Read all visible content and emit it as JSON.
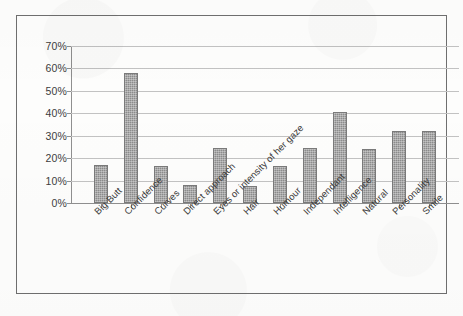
{
  "chart_data": {
    "type": "bar",
    "title": "",
    "subtitle": "",
    "xlabel": "",
    "ylabel": "",
    "ylim": [
      0,
      70
    ],
    "ytick_values": [
      0,
      10,
      20,
      30,
      40,
      50,
      60,
      70
    ],
    "ytick_labels": [
      "0%",
      "10%",
      "20%",
      "30%",
      "40%",
      "50%",
      "60%",
      "70%"
    ],
    "grid": true,
    "legend": false,
    "legend_position": "none",
    "categories": [
      "Big Butt",
      "Confidence",
      "Curves",
      "Direct approach",
      "Eyes or intensity of her gaze",
      "Hair",
      "Humour",
      "Independant",
      "Intelligence",
      "Natural",
      "Personality",
      "Smile"
    ],
    "values": [
      17,
      58,
      16.5,
      8,
      24.5,
      7.5,
      16.5,
      24.5,
      40.5,
      24,
      32,
      32
    ],
    "value_labels": [
      "17%",
      "58%",
      "17%",
      "8%",
      "24%",
      "8%",
      "17%",
      "24%",
      "40%",
      "24%",
      "32%",
      "32%"
    ],
    "series": [
      {
        "name": "Series 1",
        "values": [
          17,
          58,
          16.5,
          8,
          24.5,
          7.5,
          16.5,
          24.5,
          40.5,
          24,
          32,
          32
        ]
      }
    ],
    "colors": {
      "bar_fill": "#8c8c8c",
      "bar_edge": "#7a7a7a",
      "gridline": "#c2c2c2",
      "axis": "#8f8f8f",
      "frame": "#6f6f6f",
      "text": "#3a3a3a",
      "background": "#fdfdfc"
    }
  }
}
